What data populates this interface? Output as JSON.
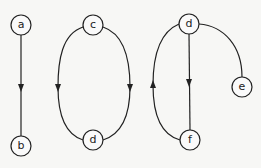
{
  "diagram": {
    "type": "directed-graphs",
    "colors": {
      "background": "#f7f7f5",
      "stroke": "#222222"
    },
    "nodes": [
      {
        "id": "a",
        "label": "a",
        "x": 21,
        "y": 25
      },
      {
        "id": "b",
        "label": "b",
        "x": 21,
        "y": 146
      },
      {
        "id": "c",
        "label": "c",
        "x": 93,
        "y": 25
      },
      {
        "id": "d1",
        "label": "d",
        "x": 93,
        "y": 140
      },
      {
        "id": "d2",
        "label": "d",
        "x": 189,
        "y": 24
      },
      {
        "id": "e",
        "label": "e",
        "x": 242,
        "y": 87
      },
      {
        "id": "f",
        "label": "f",
        "x": 190,
        "y": 140
      }
    ],
    "edges": [
      {
        "from": "a",
        "to": "b",
        "directed": true
      },
      {
        "from": "c",
        "to": "d1",
        "side": "left",
        "directed": true
      },
      {
        "from": "c",
        "to": "d1",
        "side": "right",
        "directed": true
      },
      {
        "from": "d2",
        "to": "f",
        "directed": true
      },
      {
        "from": "f",
        "to": "d2",
        "side": "left",
        "directed": true
      },
      {
        "from": "d2",
        "to": "e",
        "directed": false
      }
    ]
  }
}
